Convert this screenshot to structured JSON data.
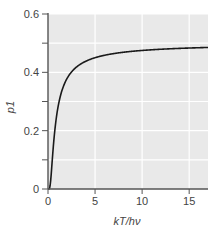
{
  "chart_data": {
    "type": "line",
    "title": "",
    "xlabel": "kT/hν",
    "ylabel": "p1",
    "xlim": [
      0,
      17
    ],
    "ylim": [
      0,
      0.6
    ],
    "xticks": [
      0,
      5,
      10,
      15
    ],
    "xtick_labels": [
      "0",
      "5",
      "10",
      "15"
    ],
    "yticks": [
      0,
      0.2,
      0.4,
      0.6
    ],
    "ytick_labels": [
      "0",
      "0.2",
      "0.4",
      "0.6"
    ],
    "y_minor_ticks": [
      0.1,
      0.3,
      0.5
    ],
    "grid": true,
    "legend": null,
    "series": [
      {
        "name": "p1",
        "formula": "exp(-1/t)/(1+exp(-1/t))",
        "x": [
          0,
          0.25,
          0.5,
          0.75,
          1,
          1.5,
          2,
          2.5,
          3,
          4,
          5,
          6,
          8,
          10,
          12,
          14,
          17
        ],
        "values": [
          0,
          0.018,
          0.119,
          0.209,
          0.269,
          0.339,
          0.378,
          0.401,
          0.417,
          0.438,
          0.45,
          0.458,
          0.469,
          0.475,
          0.479,
          0.482,
          0.485
        ]
      }
    ],
    "colors": {
      "plot_background": "#e9e9e9",
      "grid": "#ffffff",
      "line": "#1a1a1a",
      "axis": "#555555"
    }
  }
}
